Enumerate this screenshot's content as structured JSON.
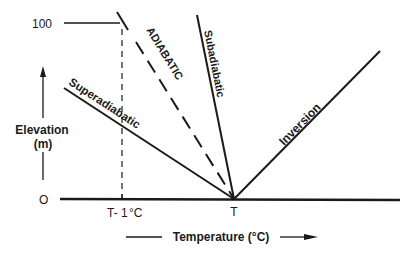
{
  "diagram": {
    "y_axis": {
      "label_line1": "Elevation",
      "label_line2": "(m)",
      "tick_top": "100",
      "tick_bottom": "O"
    },
    "x_axis": {
      "label": "Temperature (°C)",
      "tick_left": "T- 1 °C",
      "tick_left_main": "T- 1",
      "tick_left_unit": "°C",
      "tick_center": "T"
    },
    "lines": [
      {
        "name": "Superadiabatic",
        "style": "solid"
      },
      {
        "name": "ADIABATIC",
        "style": "dashed"
      },
      {
        "name": "Subadiabatic",
        "style": "solid"
      },
      {
        "name": "Inversion",
        "style": "solid"
      }
    ],
    "colors": {
      "ink": "#1a1a1a",
      "background": "#ffffff"
    }
  }
}
